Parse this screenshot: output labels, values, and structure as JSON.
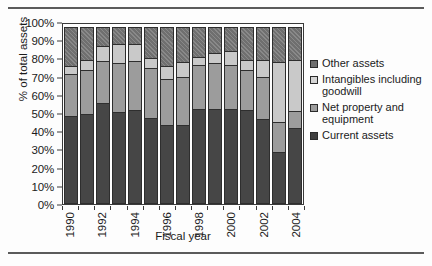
{
  "chart_data": {
    "type": "bar",
    "subtype": "stacked-100-percent",
    "title": "",
    "xlabel": "Fiscal year",
    "ylabel": "% of total assets",
    "ylim": [
      0,
      100
    ],
    "ytick_labels": [
      "100%",
      "90%",
      "80%",
      "70%",
      "60%",
      "50%",
      "40%",
      "30%",
      "20%",
      "10%",
      "0%"
    ],
    "ytick_values": [
      100,
      90,
      80,
      70,
      60,
      50,
      40,
      30,
      20,
      10,
      0
    ],
    "grid": false,
    "legend_position": "right",
    "categories": [
      "1990",
      "1991",
      "1992",
      "1993",
      "1994",
      "1995",
      "1996",
      "1997",
      "1998",
      "1999",
      "2000",
      "2001",
      "2002",
      "2003",
      "2004"
    ],
    "xtick_labels_shown": [
      "1990",
      "1992",
      "1994",
      "1996",
      "1998",
      "2000",
      "2002",
      "2004"
    ],
    "series": [
      {
        "name": "Current assets",
        "color": "#464646",
        "values": [
          49,
          50,
          56,
          51,
          52,
          48,
          44,
          44,
          53,
          53,
          53,
          52,
          47,
          29,
          42
        ]
      },
      {
        "name": "Net property and equipment",
        "color": "#9c9c9c",
        "values": [
          24,
          25,
          24,
          28,
          28,
          28,
          26,
          27,
          25,
          26,
          25,
          23,
          24,
          17,
          10
        ]
      },
      {
        "name": "Intangibles including goodwill",
        "color": "#c9c9c9",
        "values": [
          5,
          6,
          9,
          11,
          10,
          6,
          8,
          9,
          5,
          6,
          8,
          6,
          10,
          34,
          29
        ]
      },
      {
        "name": "Other assets",
        "color": "#6f6f6f",
        "values": [
          22,
          19,
          11,
          10,
          10,
          18,
          22,
          20,
          17,
          15,
          14,
          19,
          19,
          20,
          19
        ]
      }
    ]
  },
  "legend": {
    "entries": [
      {
        "label": "Other assets",
        "swatch": "sw-other"
      },
      {
        "label": "Intangibles including goodwill",
        "swatch": "sw-intang"
      },
      {
        "label": "Net property and equipment",
        "swatch": "sw-netprop"
      },
      {
        "label": "Current assets",
        "swatch": "sw-current"
      }
    ]
  }
}
